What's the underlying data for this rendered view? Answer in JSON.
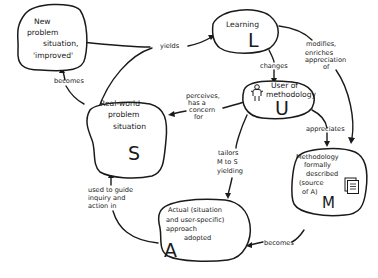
{
  "diagram": {
    "nodes": {
      "new_problem": {
        "lines": [
          "New",
          "problem",
          "situation,",
          "'improved'"
        ]
      },
      "learning": {
        "lines": [
          "Learning"
        ],
        "letter": "L"
      },
      "user": {
        "lines": [
          "User of",
          "methodology"
        ],
        "letter": "U",
        "icon": "person-icon"
      },
      "real_world": {
        "lines": [
          "Real-world",
          "problem",
          "situation"
        ],
        "letter": "S"
      },
      "methodology": {
        "lines": [
          "Methodology",
          "formally",
          "described",
          "(source",
          "of A)"
        ],
        "letter": "M",
        "icon": "document-icon"
      },
      "actual": {
        "lines": [
          "Actual (situation",
          "and user-specific)",
          "approach",
          "adopted"
        ],
        "letter": "A"
      }
    },
    "edges": {
      "yields": {
        "lines": [
          "yields"
        ]
      },
      "becomes_top": {
        "lines": [
          "becomes"
        ]
      },
      "changes": {
        "lines": [
          "changes"
        ]
      },
      "modifies": {
        "lines": [
          "modifies,",
          "enriches",
          "appreciation",
          "of"
        ]
      },
      "perceives": {
        "lines": [
          "perceives,",
          "has a",
          "concern",
          "for"
        ]
      },
      "appreciates": {
        "lines": [
          "appreciates"
        ]
      },
      "tailors": {
        "lines": [
          "tailors",
          "M to S",
          "yielding"
        ]
      },
      "used_to_guide": {
        "lines": [
          "used to guide",
          "inquiry and",
          "action in"
        ]
      },
      "becomes_bottom": {
        "lines": [
          "becomes"
        ]
      }
    }
  }
}
